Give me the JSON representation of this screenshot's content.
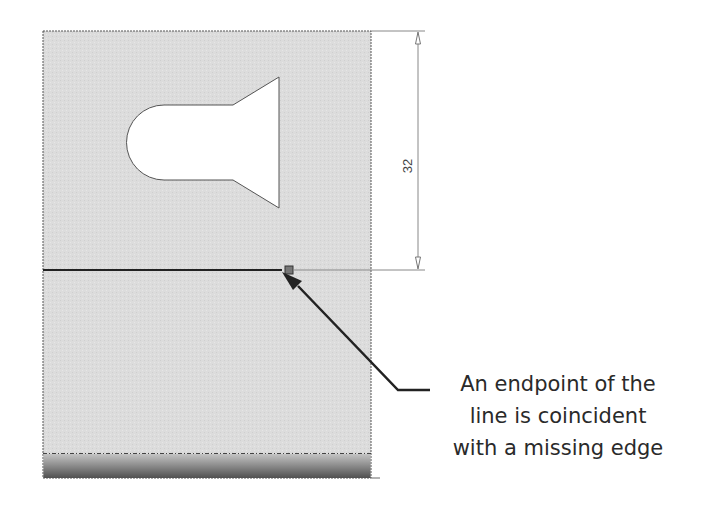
{
  "dimension": {
    "value": "32"
  },
  "callout": {
    "lines": [
      "An endpoint of the",
      "line is coincident",
      "with a missing edge"
    ]
  },
  "colors": {
    "plate_fill": "#d9d9d9",
    "edge": "#555555",
    "sketch_line": "#222222",
    "dimension_line": "#777777",
    "text": "#2a2a2a"
  }
}
